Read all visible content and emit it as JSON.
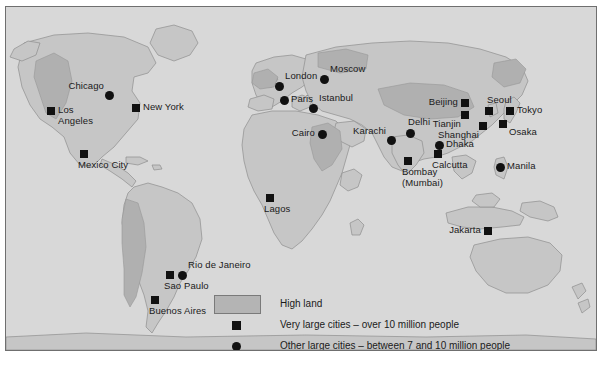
{
  "figure": {
    "background_color": "#ffffff",
    "plate_color": "#d8d8d8",
    "border_color": "#6f6f6f",
    "marker_color": "#111111",
    "highland_color": "#b4b4b4",
    "lowland_color": "#c6c6c6"
  },
  "legend": {
    "items": [
      {
        "key": "swatch",
        "label": "High land"
      },
      {
        "key": "square",
        "label": "Very large cities – over 10 million people"
      },
      {
        "key": "circle",
        "label": "Other large cities – between 7 and 10 million people"
      }
    ]
  },
  "cities": [
    {
      "name": "Chicago",
      "type": "circle",
      "x": 103,
      "y": 88,
      "anchor": "lab-aboveleft"
    },
    {
      "name": "New York",
      "type": "square",
      "x": 130,
      "y": 101,
      "anchor": "lab-right"
    },
    {
      "name": "Los\nAngeles",
      "type": "square",
      "x": 45,
      "y": 104,
      "anchor": "lab-right"
    },
    {
      "name": "Mexico City",
      "type": "square",
      "x": 78,
      "y": 147,
      "anchor": "lab-below"
    },
    {
      "name": "Rio de Janeiro",
      "type": "circle",
      "x": 176,
      "y": 268,
      "anchor": "lab-aboveright"
    },
    {
      "name": "Sao Paulo",
      "type": "square",
      "x": 164,
      "y": 268,
      "anchor": "lab-below"
    },
    {
      "name": "Buenos Aires",
      "type": "square",
      "x": 149,
      "y": 293,
      "anchor": "lab-below"
    },
    {
      "name": "London",
      "type": "circle",
      "x": 273,
      "y": 79,
      "anchor": "lab-aboveright"
    },
    {
      "name": "Paris",
      "type": "circle",
      "x": 278,
      "y": 93,
      "anchor": "lab-right"
    },
    {
      "name": "Moscow",
      "type": "circle",
      "x": 318,
      "y": 72,
      "anchor": "lab-aboveright"
    },
    {
      "name": "Istanbul",
      "type": "circle",
      "x": 307,
      "y": 101,
      "anchor": "lab-aboveright"
    },
    {
      "name": "Cairo",
      "type": "circle",
      "x": 316,
      "y": 127,
      "anchor": "lab-left"
    },
    {
      "name": "Lagos",
      "type": "square",
      "x": 264,
      "y": 191,
      "anchor": "lab-below"
    },
    {
      "name": "Karachi",
      "type": "circle",
      "x": 385,
      "y": 133,
      "anchor": "lab-aboveleft"
    },
    {
      "name": "Delhi",
      "type": "circle",
      "x": 404,
      "y": 126,
      "anchor": "lab-above"
    },
    {
      "name": "Bombay\n(Mumbai)",
      "type": "square",
      "x": 402,
      "y": 154,
      "anchor": "lab-below"
    },
    {
      "name": "Calcutta",
      "type": "square",
      "x": 432,
      "y": 147,
      "anchor": "lab-below"
    },
    {
      "name": "Dhaka",
      "type": "circle",
      "x": 433,
      "y": 138,
      "anchor": "lab-right"
    },
    {
      "name": "Beijing",
      "type": "square",
      "x": 459,
      "y": 96,
      "anchor": "lab-left"
    },
    {
      "name": "Tianjin",
      "type": "square",
      "x": 459,
      "y": 108,
      "anchor": "lab-belowleft"
    },
    {
      "name": "Shanghai",
      "type": "square",
      "x": 477,
      "y": 119,
      "anchor": "lab-belowleft"
    },
    {
      "name": "Seoul",
      "type": "square",
      "x": 483,
      "y": 104,
      "anchor": "lab-above"
    },
    {
      "name": "Tokyo",
      "type": "square",
      "x": 504,
      "y": 104,
      "anchor": "lab-right"
    },
    {
      "name": "Osaka",
      "type": "square",
      "x": 497,
      "y": 117,
      "anchor": "lab-belowright"
    },
    {
      "name": "Manila",
      "type": "circle",
      "x": 494,
      "y": 160,
      "anchor": "lab-right"
    },
    {
      "name": "Jakarta",
      "type": "square",
      "x": 482,
      "y": 224,
      "anchor": "lab-left"
    }
  ]
}
